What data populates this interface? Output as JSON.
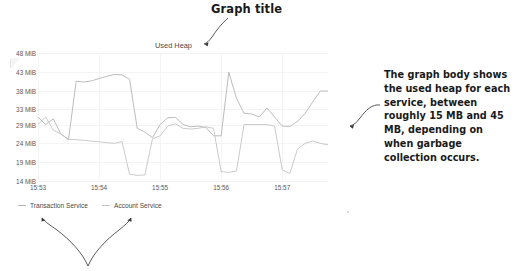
{
  "callouts": {
    "graph_title": "Graph title",
    "body_annotation": "The graph body shows the used heap for each service, between roughly 15 MB and 45 MB, depending on when garbage collection occurs."
  },
  "chart_data": {
    "type": "line",
    "title": "Used Heap",
    "xlabel": "",
    "ylabel": "",
    "ylim": [
      14,
      48
    ],
    "yunit": "MiB",
    "grid": true,
    "legend_position": "bottom-left",
    "ytick_labels": [
      "48 MiB",
      "43 MiB",
      "38 MiB",
      "33 MiB",
      "29 MiB",
      "24 MiB",
      "19 MiB",
      "14 MiB"
    ],
    "ytick_values": [
      48,
      43,
      38,
      33,
      29,
      24,
      19,
      14
    ],
    "xtick_labels": [
      "15:53",
      "15:54",
      "15:55",
      "15:56",
      "15:57"
    ],
    "xtick_values": [
      0,
      8,
      16,
      24,
      32
    ],
    "xlim": [
      0,
      38
    ],
    "series": [
      {
        "name": "Transaction Service",
        "color": "#b4b4b4",
        "x": [
          0,
          1,
          2,
          3,
          4,
          5,
          6,
          7,
          8,
          9,
          10,
          11,
          12,
          13,
          14,
          15,
          16,
          17,
          18,
          19,
          20,
          21,
          22,
          23,
          24,
          25,
          26,
          27,
          28,
          29,
          30,
          31,
          32,
          33,
          34,
          35,
          36,
          37,
          38
        ],
        "values": [
          31.0,
          29.0,
          30.5,
          26.5,
          25.0,
          40.5,
          40.3,
          40.6,
          41.2,
          41.8,
          42.3,
          42.2,
          41.0,
          28.0,
          27.0,
          25.5,
          29.0,
          30.8,
          30.9,
          29.0,
          28.4,
          28.6,
          28.2,
          26.0,
          26.0,
          42.9,
          36.0,
          32.0,
          31.8,
          31.0,
          33.4,
          31.0,
          28.6,
          28.5,
          29.8,
          32.0,
          35.0,
          37.9,
          37.9
        ]
      },
      {
        "name": "Account Service",
        "color": "#c4c4c4",
        "x": [
          0,
          1,
          2,
          3,
          4,
          5,
          6,
          7,
          8,
          9,
          10,
          11,
          12,
          13,
          14,
          15,
          16,
          17,
          18,
          19,
          20,
          21,
          22,
          23,
          24,
          25,
          26,
          27,
          28,
          29,
          30,
          31,
          32,
          33,
          34,
          35,
          36,
          37,
          38
        ],
        "values": [
          29.0,
          31.0,
          27.5,
          26.5,
          25.0,
          25.0,
          24.8,
          24.6,
          24.4,
          24.2,
          24.0,
          24.5,
          15.8,
          15.5,
          15.6,
          25.2,
          26.0,
          28.6,
          29.2,
          28.0,
          27.8,
          28.0,
          28.4,
          28.0,
          16.5,
          16.3,
          16.6,
          29.0,
          29.0,
          29.0,
          29.0,
          28.6,
          17.0,
          16.0,
          22.5,
          24.0,
          24.6,
          24.0,
          23.6
        ]
      }
    ]
  },
  "legend": {
    "items": [
      {
        "label": "Transaction Service"
      },
      {
        "label": "Account Service"
      }
    ]
  }
}
